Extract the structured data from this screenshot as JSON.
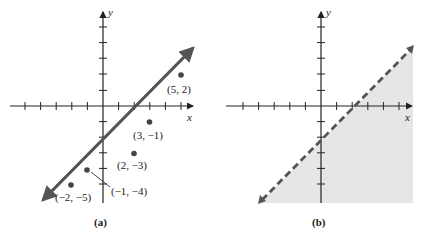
{
  "panels": [
    {
      "caption": "(a)",
      "x_label": "x",
      "y_label": "y",
      "line": {
        "equation": "2x - 3y = 6",
        "style": "solid",
        "slope": 0.6667,
        "y_intercept": -2,
        "x_intercept": 3
      },
      "points": [
        {
          "x": 5,
          "y": 2,
          "label": "(5, 2)"
        },
        {
          "x": 3,
          "y": -1,
          "label": "(3, −1)"
        },
        {
          "x": 2,
          "y": -3,
          "label": "(2, −3)"
        },
        {
          "x": -1,
          "y": -4,
          "label": "(−1, −4)"
        },
        {
          "x": -2,
          "y": -5,
          "label": "(−2, −5)"
        }
      ]
    },
    {
      "caption": "(b)",
      "x_label": "x",
      "y_label": "y",
      "line": {
        "style": "dashed",
        "slope": 0.6667,
        "y_intercept": -2,
        "x_intercept": 3
      },
      "shaded_region": "below-right of line",
      "shade_color": "#e6e6e6"
    }
  ],
  "colors": {
    "line": "#555555",
    "axis": "#222222",
    "point": "#444444",
    "shade": "#e6e6e6"
  }
}
